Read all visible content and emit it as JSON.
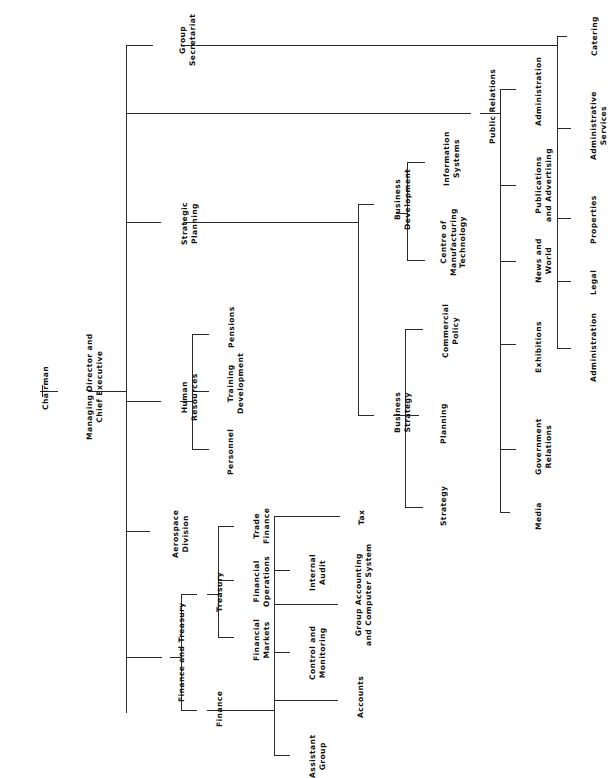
{
  "chart_title": "",
  "nodes": {
    "chairman": "Chairman",
    "md": [
      "Managing Director and",
      "Chief Executive"
    ],
    "group_secretariat": [
      "Group",
      "Secretariat"
    ],
    "catering": "Catering",
    "public_relations": "Public Relations",
    "strategic_planning": [
      "Strategic",
      "Planning"
    ],
    "human_resources": [
      "Human",
      "Resources"
    ],
    "aerospace": [
      "Aerospace",
      "Division"
    ],
    "finance_treasury": "Finance and Treasury",
    "treasury": "Treasury",
    "finance": "Finance",
    "financial_markets": [
      "Financial",
      "Markets"
    ],
    "financial_operations": [
      "Financial",
      "Operations"
    ],
    "trade_finance": [
      "Trade",
      "Finance"
    ],
    "assistant_group": [
      "Assistant",
      "Group"
    ],
    "control_monitoring": [
      "Control and",
      "Monitoring"
    ],
    "internal_audit": [
      "Internal",
      "Audit"
    ],
    "accounts": "Accounts",
    "group_accounting": [
      "Group Accounting",
      "and Computer System"
    ],
    "tax": "Tax",
    "personnel": "Personnel",
    "training": [
      "Training",
      "Development"
    ],
    "pensions": "Pensions",
    "business_development": [
      "Business",
      "Development"
    ],
    "business_strategy": [
      "Business",
      "Strategy"
    ],
    "information_systems": [
      "Information",
      "Systems"
    ],
    "centre_manufacturing": [
      "Centre of",
      "Manufacturing",
      "Technology"
    ],
    "commercial_policy": [
      "Commercial",
      "Policy"
    ],
    "planning": "Planning",
    "strategy": "Strategy",
    "pr_administration": "Administration",
    "publications": [
      "Publications",
      "and Advertising"
    ],
    "news_world": [
      "News and",
      "World"
    ],
    "exhibitions": "Exhibitions",
    "government_relations": [
      "Government",
      "Relations"
    ],
    "media": "Media",
    "administrative_services": [
      "Administrative",
      "Services"
    ],
    "properties": "Properties",
    "legal": "Legal",
    "as_administration": "Administration"
  },
  "line_color": "#2a2a2a"
}
